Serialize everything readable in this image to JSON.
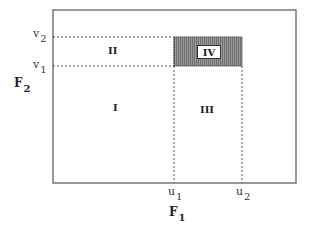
{
  "diagram": {
    "x_axis_label": "F",
    "x_axis_sub": "1",
    "y_axis_label": "F",
    "y_axis_sub": "2",
    "x_ticks": [
      {
        "base": "u",
        "sub": "1"
      },
      {
        "base": "u",
        "sub": "2"
      }
    ],
    "y_ticks": [
      {
        "base": "v",
        "sub": "2"
      },
      {
        "base": "v",
        "sub": "1"
      }
    ],
    "regions": [
      {
        "label": "I"
      },
      {
        "label": "II"
      },
      {
        "label": "III"
      },
      {
        "label": "IV",
        "shaded": true
      }
    ],
    "colors": {
      "frame": "#777777",
      "dotted": "#555555",
      "shade": "#8a8a8a"
    }
  }
}
